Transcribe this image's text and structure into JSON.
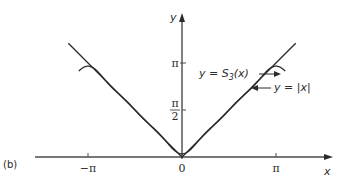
{
  "figure": {
    "panel_label": "(b)",
    "annotations": {
      "s3_label": {
        "prefix": "y = ",
        "fn": "S",
        "sub": "3",
        "suffix": "(x)"
      },
      "abs_label": "y = |x|"
    }
  },
  "chart_data": {
    "type": "line",
    "title": "",
    "xlabel": "x",
    "ylabel": "y",
    "xlim": [
      -3.93,
      4.3
    ],
    "ylim": [
      -0.6,
      4.5
    ],
    "x_ticks": [
      {
        "value": -3.14159,
        "label": "−π"
      },
      {
        "value": 0,
        "label": "0"
      },
      {
        "value": 3.14159,
        "label": "π"
      }
    ],
    "y_ticks": [
      {
        "value": 1.5708,
        "label": "π/2"
      },
      {
        "value": 3.14159,
        "label": "π"
      }
    ],
    "grid": false,
    "series": [
      {
        "name": "y = |x|",
        "formula": "abs(x)",
        "x_range": [
          -3.8,
          3.8
        ]
      },
      {
        "name": "y = S3(x)",
        "formula": "pi/2 - (4/pi)*(cos(x) + cos(3x)/9 + cos(5x)/25)",
        "x_range": [
          -3.45,
          3.45
        ]
      }
    ]
  }
}
